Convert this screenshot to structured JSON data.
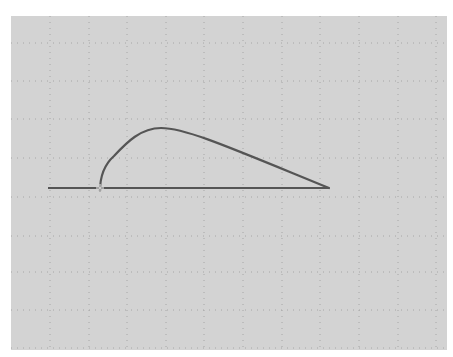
{
  "canvas": {
    "background": "#d3d3d3",
    "grid_color": "#a6a6a6",
    "line_color": "#555555",
    "grid": {
      "x_lines": [
        39,
        78,
        116,
        155,
        193,
        232,
        271,
        309,
        348,
        387,
        425
      ],
      "y_lines": [
        27,
        65,
        103,
        142,
        181,
        220,
        256,
        294,
        332
      ]
    }
  },
  "shape": {
    "baseline": {
      "x1": 37,
      "y1": 172,
      "x2": 318,
      "y2": 172
    },
    "curve_path": "M 89 175 C 89 160, 94 148, 103 140 C 116 126, 130 112, 150 112 C 175 112, 220 132, 318 172",
    "start_marker": {
      "x": 89,
      "y": 172
    }
  }
}
